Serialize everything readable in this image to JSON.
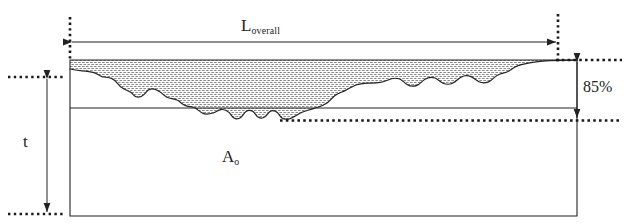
{
  "figure": {
    "background_color": "#ffffff",
    "line_color": "#232323",
    "hatch_color": "#8c8c8c"
  },
  "labels": {
    "overall_length": {
      "base": "L",
      "sub": "overall",
      "text": "L overall"
    },
    "thickness": {
      "base": "t",
      "sub": "",
      "text": "t"
    },
    "core_area": {
      "base": "A",
      "sub": "o",
      "text": "A o"
    },
    "percentage": {
      "text": "85%"
    }
  },
  "geometry": {
    "body_rect": {
      "x": 70,
      "y": 60,
      "width": 507,
      "height": 156
    },
    "bearing_line_y": 108,
    "datum_line_y": 120,
    "overall_arrow_y": 42,
    "overall_arrow_x1": 70,
    "overall_arrow_x2": 558,
    "thickness_arrow_x": 47,
    "thickness_arrow_y1": 77,
    "thickness_arrow_y2": 214,
    "pct_arrow_x": 577,
    "pct_arrow_y1": 60,
    "pct_arrow_y2": 120
  },
  "elements": {
    "profile_curve_name": "rough-surface-profile",
    "hatch_region_name": "peak-material-hatch-region",
    "dotted_guides": [
      "top-left-vertical-guide",
      "top-right-vertical-guide",
      "left-horizontal-guide",
      "bottom-left-horizontal-guide",
      "right-top-horizontal-guide",
      "right-datum-horizontal-guide"
    ]
  }
}
